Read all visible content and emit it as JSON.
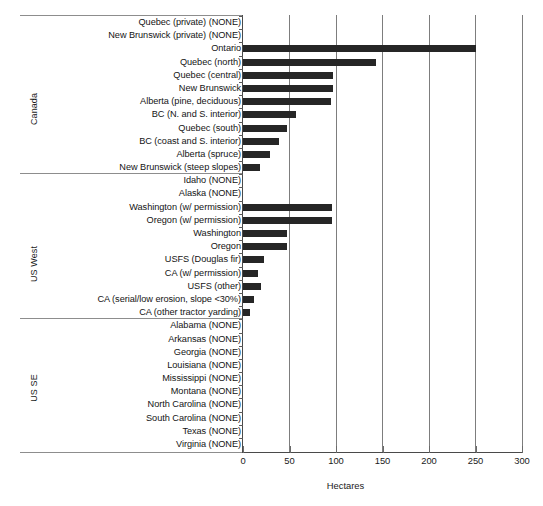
{
  "chart_data": {
    "type": "bar",
    "orientation": "horizontal",
    "title": "",
    "xlabel": "Hectares",
    "ylabel": "",
    "xlim": [
      0,
      300
    ],
    "xticks": [
      0,
      50,
      100,
      150,
      200,
      250,
      300
    ],
    "xtick_labels": [
      "0",
      "50",
      "100",
      "150",
      "200",
      "250",
      "300"
    ],
    "grid": "vertical gridlines at each x tick",
    "legend": "none",
    "bar_color": "#262626",
    "groups": [
      {
        "name": "Canada",
        "categories": [
          "Quebec (private) (NONE)",
          "New Brunswick (private) (NONE)",
          "Ontario",
          "Quebec (north)",
          "Quebec (central)",
          "New Brunswick",
          "Alberta (pine, deciduous)",
          "BC (N. and S. interior)",
          "Quebec (south)",
          "BC (coast and S. interior)",
          "Alberta (spruce)",
          "New Brunswick (steep slopes)"
        ],
        "values": [
          0,
          0,
          250,
          143,
          97,
          97,
          95,
          57,
          47,
          39,
          29,
          18
        ]
      },
      {
        "name": "US West",
        "categories": [
          "Idaho (NONE)",
          "Alaska (NONE)",
          "Washington (w/ permission)",
          "Oregon (w/ permission)",
          "Washington",
          "Oregon",
          "USFS (Douglas fir)",
          "CA (w/ permission)",
          "USFS (other)",
          "CA (serial/low erosion, slope <30%)",
          "CA (other tractor yarding)"
        ],
        "values": [
          0,
          0,
          96,
          96,
          47,
          47,
          23,
          16,
          19,
          12,
          8
        ]
      },
      {
        "name": "US SE",
        "categories": [
          "Alabama (NONE)",
          "Arkansas (NONE)",
          "Georgia (NONE)",
          "Louisiana (NONE)",
          "Mississippi (NONE)",
          "Montana (NONE)",
          "North Carolina (NONE)",
          "South Carolina (NONE)",
          "Texas (NONE)",
          "Virginia (NONE)"
        ],
        "values": [
          0,
          0,
          0,
          0,
          0,
          0,
          0,
          0,
          0,
          0
        ]
      }
    ]
  }
}
